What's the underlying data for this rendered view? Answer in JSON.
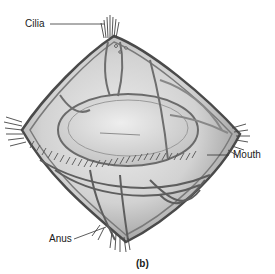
{
  "figure": {
    "caption": "(b)",
    "labels": [
      {
        "id": "cilia",
        "text": "Cilia"
      },
      {
        "id": "mouth",
        "text": "Mouth"
      },
      {
        "id": "anus",
        "text": "Anus"
      }
    ]
  },
  "colors": {
    "background": "#ffffff",
    "body_fill": "#d4d4d4",
    "body_light": "#e6e6e6",
    "outline": "#555555",
    "label_text": "#1a1a1a",
    "leader_line": "#333333"
  }
}
